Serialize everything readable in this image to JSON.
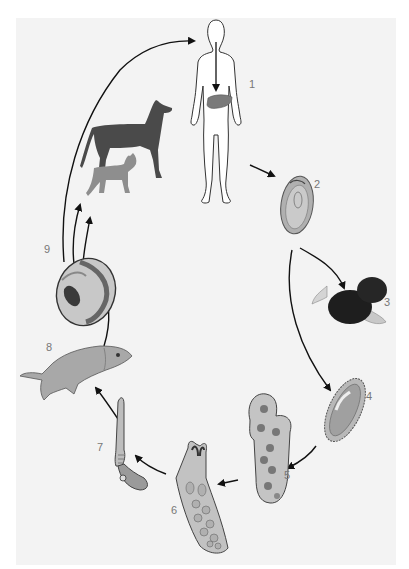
{
  "diagram": {
    "type": "life-cycle",
    "background_color": "#f3f3f3",
    "stages": [
      {
        "number": "1",
        "label": "1",
        "subject": "human host with liver"
      },
      {
        "number": "2",
        "label": "2",
        "subject": "egg"
      },
      {
        "number": "3",
        "label": "3",
        "subject": "snail"
      },
      {
        "number": "4",
        "label": "4",
        "subject": "miracidium"
      },
      {
        "number": "5",
        "label": "5",
        "subject": "sporocyst"
      },
      {
        "number": "6",
        "label": "6",
        "subject": "redia"
      },
      {
        "number": "7",
        "label": "7",
        "subject": "cercaria"
      },
      {
        "number": "8",
        "label": "8",
        "subject": "fish"
      },
      {
        "number": "9",
        "label": "9",
        "subject": "metacercaria cyst"
      }
    ],
    "reservoir_hosts": [
      "dog",
      "cat"
    ],
    "colors": {
      "arrow": "#111111",
      "outline": "#444444",
      "liver": "#7a7a7a",
      "dog": "#4a4a4a",
      "cat": "#8e8e8e",
      "snail": "#1e1e1e",
      "tissue": "#c4c4c4",
      "fish": "#a8a8a8"
    }
  }
}
